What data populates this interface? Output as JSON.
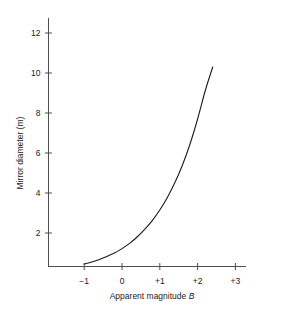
{
  "figure": {
    "top_fragment": "·                                                ·   · ·",
    "background": "#ffffff",
    "line_color": "#1a1a1a",
    "axis_color": "#4d4d4d"
  },
  "chart_data": {
    "type": "line",
    "title": "",
    "xlabel": "Apparent magnitude B",
    "ylabel": "Mirror diameter (m)",
    "xlabel_symbol": "B",
    "xlabel_prefix": "Apparent magnitude ",
    "xlim": [
      -1.55,
      3.35
    ],
    "ylim": [
      0,
      13.2
    ],
    "xticks": [
      -1,
      0,
      1,
      2,
      3
    ],
    "xticklabels": [
      "−1",
      "0",
      "+1",
      "+2",
      "+3"
    ],
    "yticks": [
      2,
      4,
      6,
      8,
      10,
      12
    ],
    "yticklabels": [
      "2",
      "4",
      "6",
      "8",
      "10",
      "12"
    ],
    "grid": false,
    "legend": false,
    "series": [
      {
        "name": "Mirror diameter vs apparent magnitude",
        "x": [
          -1.0,
          -0.8,
          -0.6,
          -0.4,
          -0.2,
          0.0,
          0.2,
          0.4,
          0.6,
          0.8,
          1.0,
          1.2,
          1.4,
          1.6,
          1.8,
          2.0,
          2.2,
          2.4
        ],
        "y": [
          0.45,
          0.55,
          0.68,
          0.83,
          1.0,
          1.22,
          1.48,
          1.8,
          2.18,
          2.62,
          3.15,
          3.78,
          4.52,
          5.4,
          6.45,
          7.7,
          9.1,
          10.3
        ]
      }
    ]
  }
}
